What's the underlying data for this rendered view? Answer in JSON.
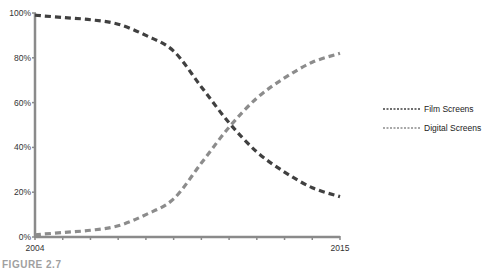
{
  "caption": "FIGURE 2.7",
  "chart_data": {
    "type": "line",
    "title": "",
    "xlabel": "",
    "ylabel": "",
    "x": [
      2004,
      2005,
      2006,
      2007,
      2008,
      2009,
      2010,
      2011,
      2012,
      2013,
      2014,
      2015
    ],
    "x_tick_labels": [
      "2004",
      "2015"
    ],
    "y_tick_labels": [
      "0%",
      "20%",
      "40%",
      "60%",
      "80%",
      "100%"
    ],
    "ylim": [
      0,
      100
    ],
    "grid": false,
    "legend_position": "right",
    "series": [
      {
        "name": "Film Screens",
        "color": "#404040",
        "style": "dashed",
        "values": [
          99,
          98,
          97,
          95,
          90,
          83,
          67,
          51,
          38,
          29,
          22,
          18
        ]
      },
      {
        "name": "Digital Screens",
        "color": "#8c8c8c",
        "style": "dashed",
        "values": [
          1,
          2,
          3,
          5,
          10,
          17,
          33,
          49,
          62,
          71,
          78,
          82
        ]
      }
    ]
  }
}
